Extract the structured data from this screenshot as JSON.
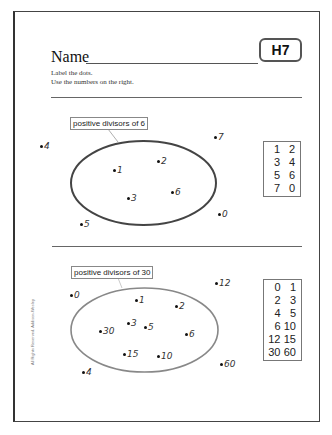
{
  "header": {
    "name_label": "Name",
    "badge": "H7",
    "instructions": [
      "Label the dots.",
      "Use the numbers on the right."
    ]
  },
  "sections": [
    {
      "label": "positive divisors of 6",
      "dots": [
        {
          "text": "4",
          "x": 40,
          "y": 146
        },
        {
          "text": "1",
          "x": 113,
          "y": 170
        },
        {
          "text": "2",
          "x": 157,
          "y": 161
        },
        {
          "text": "3",
          "x": 127,
          "y": 198
        },
        {
          "text": "6",
          "x": 171,
          "y": 192
        },
        {
          "text": "7",
          "x": 214,
          "y": 137
        },
        {
          "text": "0",
          "x": 218,
          "y": 214
        },
        {
          "text": "5",
          "x": 80,
          "y": 224
        }
      ],
      "numbers": [
        "1",
        "2",
        "3",
        "4",
        "5",
        "6",
        "7",
        "0"
      ]
    },
    {
      "label": "positive divisors of 30",
      "dots": [
        {
          "text": "0",
          "x": 70,
          "y": 295
        },
        {
          "text": "1",
          "x": 135,
          "y": 300
        },
        {
          "text": "2",
          "x": 175,
          "y": 306
        },
        {
          "text": "3",
          "x": 127,
          "y": 323
        },
        {
          "text": "5",
          "x": 144,
          "y": 327
        },
        {
          "text": "30",
          "x": 99,
          "y": 331
        },
        {
          "text": "6",
          "x": 185,
          "y": 334
        },
        {
          "text": "15",
          "x": 123,
          "y": 354
        },
        {
          "text": "10",
          "x": 157,
          "y": 356
        },
        {
          "text": "12",
          "x": 215,
          "y": 283
        },
        {
          "text": "60",
          "x": 220,
          "y": 364
        },
        {
          "text": "4",
          "x": 82,
          "y": 372
        }
      ],
      "numbers": [
        "0",
        "1",
        "2",
        "3",
        "4",
        "5",
        "6",
        "10",
        "12",
        "15",
        "30",
        "60"
      ]
    }
  ],
  "footer": {
    "credit": "All Rights Reserved. Addison-Wesley"
  },
  "colors": {
    "ellipse_1": "#444444",
    "ellipse_2": "#888888"
  }
}
